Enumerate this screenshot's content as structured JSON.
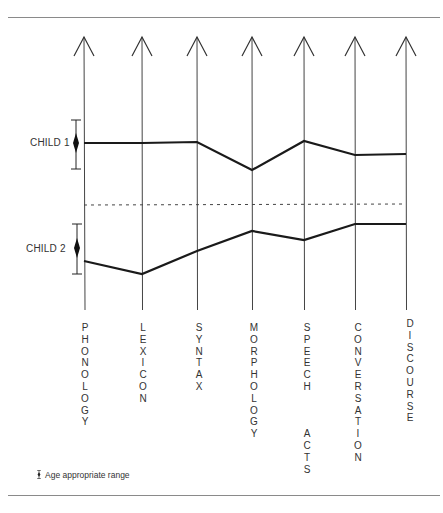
{
  "chart_data": {
    "type": "line",
    "title": "",
    "xlabel": "",
    "ylabel": "",
    "categories": [
      "PHONOLOGY",
      "LEXICON",
      "SYNTAX",
      "MORPHOLOGY",
      "SPEECH ACTS",
      "CONVERSATION",
      "DISCOURSE"
    ],
    "series": [
      {
        "name": "CHILD 1",
        "values_px_y": [
          143,
          143,
          142,
          170,
          141,
          155,
          154
        ],
        "age_appropriate_range_px_y": {
          "top": 120,
          "center": 143,
          "bottom": 169
        },
        "relative_to_midpoint": [
          0,
          0,
          1,
          -27,
          2,
          -12,
          -11
        ]
      },
      {
        "name": "CHILD 2",
        "values_px_y": [
          261,
          274,
          251,
          231,
          240,
          224,
          224
        ],
        "age_appropriate_range_px_y": {
          "top": 224,
          "center": 248,
          "bottom": 274
        },
        "relative_to_midpoint": [
          -13,
          -26,
          -3,
          17,
          8,
          24,
          24
        ]
      }
    ],
    "separator": {
      "style": "dashed",
      "y_px": 204
    },
    "axes": {
      "count": 7,
      "orientation": "vertical",
      "arrowheads": "up",
      "grid": false
    },
    "legend": {
      "position": "bottom-left",
      "entries": [
        "Age appropriate range"
      ]
    }
  },
  "labels": {
    "child1": "CHILD 1",
    "child2": "CHILD 2",
    "categories": [
      "PHONOLOGY",
      "LEXICON",
      "SYNTAX",
      "MORPHOLOGY",
      "SPEECH\n\nACTS",
      "CONVERSATION",
      "DISCOURSE"
    ]
  },
  "legend": {
    "text": "Age appropriate range",
    "symbol": "range-bar-icon"
  },
  "colors": {
    "line": "#1a1a1a",
    "axis": "#444444",
    "rule": "#8a8a8a",
    "background": "#ffffff"
  }
}
